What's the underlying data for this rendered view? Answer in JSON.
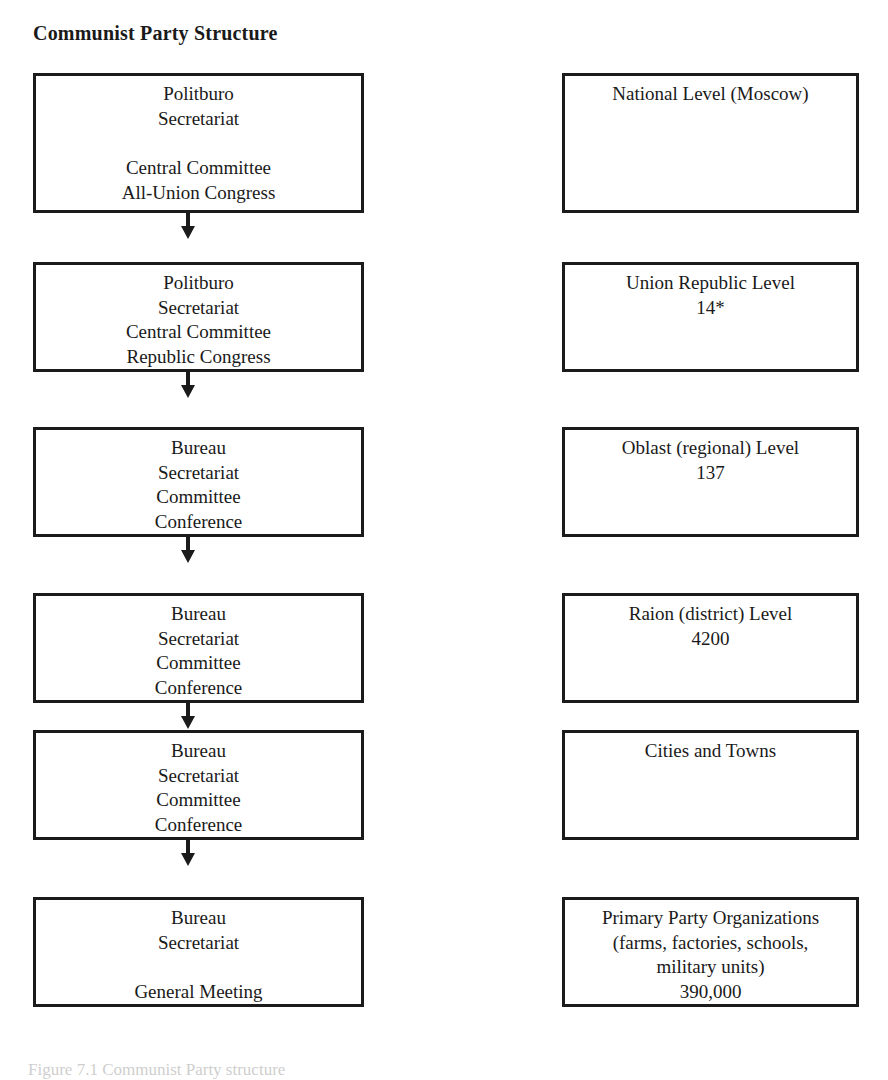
{
  "title": "Communist Party Structure",
  "caption": "Figure 7.1  Communist Party structure",
  "colors": {
    "border": "#1b1b1b",
    "text": "#1a1a1a",
    "background": "#ffffff",
    "caption": "#5c5c5c"
  },
  "arrow_icon": "down-arrow-icon",
  "rows": [
    {
      "top": 73,
      "height": 140,
      "arrow_top": 213,
      "has_arrow": true,
      "left": {
        "lines": [
          "Politburo",
          "Secretariat",
          "",
          "Central Committee",
          "All-Union Congress"
        ]
      },
      "right": {
        "lines": [
          "National Level (Moscow)"
        ]
      }
    },
    {
      "top": 262,
      "height": 110,
      "arrow_top": 372,
      "has_arrow": true,
      "left": {
        "lines": [
          "Politburo",
          "Secretariat",
          "Central Committee",
          "Republic Congress"
        ]
      },
      "right": {
        "lines": [
          "Union Republic Level",
          "14*"
        ]
      }
    },
    {
      "top": 427,
      "height": 110,
      "arrow_top": 537,
      "has_arrow": true,
      "left": {
        "lines": [
          "Bureau",
          "Secretariat",
          "Committee",
          "Conference"
        ]
      },
      "right": {
        "lines": [
          "Oblast (regional) Level",
          "137"
        ]
      }
    },
    {
      "top": 593,
      "height": 110,
      "arrow_top": 703,
      "has_arrow": true,
      "left": {
        "lines": [
          "Bureau",
          "Secretariat",
          "Committee",
          "Conference"
        ]
      },
      "right": {
        "lines": [
          "Raion (district) Level",
          "4200"
        ]
      }
    },
    {
      "top": 730,
      "height": 110,
      "arrow_top": 840,
      "has_arrow": true,
      "left": {
        "lines": [
          "Bureau",
          "Secretariat",
          "Committee",
          "Conference"
        ]
      },
      "right": {
        "lines": [
          "Cities and Towns"
        ]
      }
    },
    {
      "top": 897,
      "height": 110,
      "arrow_top": 0,
      "has_arrow": false,
      "left": {
        "lines": [
          "Bureau",
          "Secretariat",
          "",
          "General Meeting"
        ]
      },
      "right": {
        "lines": [
          "Primary Party Organizations",
          "(farms, factories, schools,",
          "military units)",
          "390,000"
        ]
      }
    }
  ]
}
